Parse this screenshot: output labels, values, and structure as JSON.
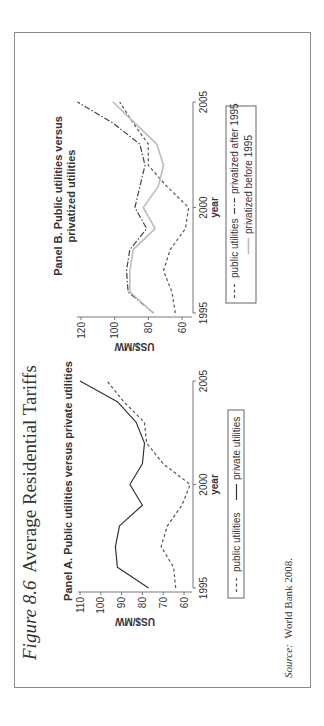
{
  "figure": {
    "label": "Figure 8.6",
    "title": "Average Residential Tariffs",
    "source_label": "Source:",
    "source_text": "World Bank 2008."
  },
  "chart_data": [
    {
      "type": "line",
      "title": "Panel A. Public utilities versus private utilities",
      "xlabel": "year",
      "ylabel": "US$/MW",
      "x": [
        1995,
        1996,
        1997,
        1998,
        1999,
        2000,
        2001,
        2002,
        2003,
        2004,
        2005
      ],
      "x_ticks": [
        1995,
        2000,
        2005
      ],
      "y_ticks": [
        60,
        70,
        80,
        90,
        100,
        110
      ],
      "ylim": [
        55,
        110
      ],
      "series": [
        {
          "name": "public utilities",
          "style": "dashed",
          "color": "#555555",
          "values": [
            64,
            65,
            71,
            68,
            61,
            57,
            70,
            78,
            79,
            89,
            97
          ]
        },
        {
          "name": "private utilities",
          "style": "solid",
          "color": "#333333",
          "values": [
            77,
            92,
            93,
            91,
            80,
            86,
            80,
            79,
            83,
            92,
            110
          ]
        }
      ],
      "legend": {
        "position": "bottom",
        "entries": [
          "public utilities",
          "private utilities"
        ]
      }
    },
    {
      "type": "line",
      "title": "Panel B. Public utilities versus privatized utilities",
      "xlabel": "year",
      "ylabel": "US$/MW",
      "x": [
        1995,
        1996,
        1997,
        1998,
        1999,
        2000,
        2001,
        2002,
        2003,
        2004,
        2005
      ],
      "x_ticks": [
        1995,
        2000,
        2005
      ],
      "y_ticks": [
        60,
        80,
        100,
        120
      ],
      "ylim": [
        55,
        122
      ],
      "series": [
        {
          "name": "public utilities",
          "style": "dashed",
          "color": "#555555",
          "values": [
            64,
            66,
            71,
            67,
            58,
            56,
            69,
            80,
            80,
            89,
            97
          ]
        },
        {
          "name": "privatized after 1995",
          "style": "dashdot",
          "color": "#444444",
          "values": [
            77,
            92,
            93,
            91,
            81,
            88,
            85,
            82,
            85,
            101,
            122
          ]
        },
        {
          "name": "privatized before 1995",
          "style": "solid-light",
          "color": "#bdbdbd",
          "values": [
            77,
            91,
            91,
            89,
            76,
            83,
            74,
            71,
            75,
            88,
            101
          ]
        }
      ],
      "legend": {
        "position": "bottom",
        "entries": [
          "public utilities",
          "privatized after 1995",
          "privatized before 1995"
        ]
      }
    }
  ]
}
